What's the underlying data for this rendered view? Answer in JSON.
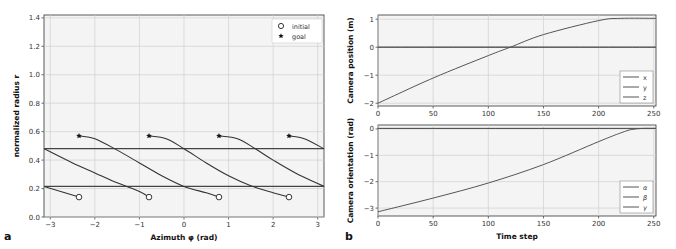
{
  "panels": {
    "a": {
      "label": "a"
    },
    "b": {
      "label": "b"
    }
  },
  "chart_data": [
    {
      "type": "line",
      "panel": "a",
      "title": "",
      "xlabel": "Azimuth φ (rad)",
      "ylabel": "normalized radius r",
      "xlim": [
        -3.14159,
        3.14159
      ],
      "ylim": [
        0.0,
        1.42
      ],
      "xticks": [
        -3,
        -2,
        -1,
        0,
        1,
        2,
        3
      ],
      "xtick_labels": [
        "−3",
        "−2",
        "−1",
        "0",
        "1",
        "2",
        "3"
      ],
      "yticks": [
        0.0,
        0.2,
        0.4,
        0.6,
        0.8,
        1.0,
        1.2,
        1.4
      ],
      "ytick_labels": [
        "0.0",
        "0.2",
        "0.4",
        "0.6",
        "0.8",
        "1.0",
        "1.2",
        "1.4"
      ],
      "grid": true,
      "legend": {
        "position": "upper right",
        "entries": [
          {
            "label": "initial",
            "marker": "open-circle"
          },
          {
            "label": "goal",
            "marker": "star"
          }
        ]
      },
      "horizontal_lines": [
        0.215,
        0.48
      ],
      "initial_points": [
        {
          "x": -2.356,
          "y": 0.14
        },
        {
          "x": -0.785,
          "y": 0.14
        },
        {
          "x": 0.785,
          "y": 0.14
        },
        {
          "x": 2.356,
          "y": 0.14
        }
      ],
      "goal_points": [
        {
          "x": -2.356,
          "y": 0.57
        },
        {
          "x": -0.785,
          "y": 0.57
        },
        {
          "x": 0.785,
          "y": 0.57
        },
        {
          "x": 2.356,
          "y": 0.57
        }
      ],
      "series": [
        {
          "name": "traj1",
          "x": [
            -2.356,
            -2.0,
            -1.5,
            -1.0,
            -0.5,
            0.0,
            0.5,
            0.785
          ],
          "y": [
            0.57,
            0.55,
            0.47,
            0.38,
            0.29,
            0.215,
            0.17,
            0.14
          ]
        },
        {
          "name": "traj2",
          "x": [
            -0.785,
            -0.4,
            0.0,
            0.5,
            1.0,
            1.5,
            2.0,
            2.356
          ],
          "y": [
            0.57,
            0.55,
            0.48,
            0.38,
            0.29,
            0.22,
            0.17,
            0.14
          ]
        },
        {
          "name": "traj3",
          "x": [
            0.785,
            1.2,
            1.6,
            2.0,
            2.5,
            3.14
          ],
          "y": [
            0.57,
            0.55,
            0.48,
            0.4,
            0.31,
            0.215
          ]
        },
        {
          "name": "traj4",
          "x": [
            2.356,
            2.7,
            3.14
          ],
          "y": [
            0.57,
            0.55,
            0.48
          ]
        },
        {
          "name": "traj4-wrap",
          "x": [
            -3.14,
            -2.5,
            -2.0,
            -1.5,
            -1.0,
            -0.785
          ],
          "y": [
            0.48,
            0.38,
            0.31,
            0.24,
            0.18,
            0.14
          ]
        },
        {
          "name": "traj3-wrap",
          "x": [
            -3.14,
            -2.356
          ],
          "y": [
            0.215,
            0.14
          ]
        }
      ]
    },
    {
      "type": "line",
      "panel": "b-top",
      "xlabel": "",
      "ylabel": "Camera position (m)",
      "xlim": [
        0,
        252
      ],
      "ylim": [
        -2.1,
        1.15
      ],
      "xticks": [
        0,
        50,
        100,
        150,
        200,
        250
      ],
      "xtick_labels": [
        "0",
        "50",
        "100",
        "150",
        "200",
        "250"
      ],
      "yticks": [
        -2,
        -1,
        0,
        1
      ],
      "ytick_labels": [
        "−2",
        "−1",
        "0",
        "1"
      ],
      "grid": true,
      "legend": {
        "position": "lower right",
        "entries": [
          "x",
          "y",
          "z"
        ]
      },
      "series": [
        {
          "name": "x",
          "x": [
            0,
            50,
            100,
            120,
            150,
            200,
            220,
            252
          ],
          "y": [
            -2.0,
            -1.1,
            -0.3,
            0.0,
            0.45,
            0.95,
            1.03,
            1.03
          ]
        },
        {
          "name": "y",
          "x": [
            0,
            252
          ],
          "y": [
            0,
            0
          ]
        },
        {
          "name": "z",
          "x": [
            0,
            252
          ],
          "y": [
            0,
            0
          ]
        }
      ]
    },
    {
      "type": "line",
      "panel": "b-bottom",
      "xlabel": "Time step",
      "ylabel": "Camera orientation (rad)",
      "xlim": [
        0,
        252
      ],
      "ylim": [
        -3.3,
        0.15
      ],
      "xticks": [
        0,
        50,
        100,
        150,
        200,
        250
      ],
      "xtick_labels": [
        "0",
        "50",
        "100",
        "150",
        "200",
        "250"
      ],
      "yticks": [
        -3,
        -2,
        -1,
        0
      ],
      "ytick_labels": [
        "−3",
        "−2",
        "−1",
        "0"
      ],
      "grid": true,
      "legend": {
        "position": "lower right",
        "entries": [
          "α",
          "β",
          "γ"
        ]
      },
      "series": [
        {
          "name": "α",
          "x": [
            0,
            50,
            100,
            150,
            200,
            220,
            230,
            240,
            252
          ],
          "y": [
            -3.14,
            -2.62,
            -2.05,
            -1.35,
            -0.48,
            -0.15,
            -0.02,
            0.02,
            0.02
          ]
        },
        {
          "name": "β",
          "x": [
            0,
            252
          ],
          "y": [
            0.02,
            0.02
          ]
        },
        {
          "name": "γ",
          "x": [
            0,
            252
          ],
          "y": [
            0.02,
            0.02
          ]
        }
      ]
    }
  ]
}
